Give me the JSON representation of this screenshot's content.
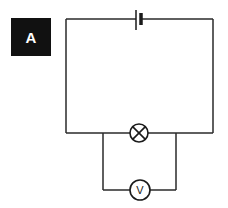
{
  "figure": {
    "label": "A"
  },
  "components": {
    "cell": {
      "type": "cell",
      "symbol": "battery-cell"
    },
    "lamp": {
      "type": "lamp",
      "symbol": "circle-with-cross"
    },
    "voltmeter": {
      "type": "voltmeter",
      "symbol_text": "V"
    }
  },
  "colors": {
    "wire": "#2a2a2a",
    "label_bg": "#111111",
    "label_fg": "#ffffff"
  }
}
